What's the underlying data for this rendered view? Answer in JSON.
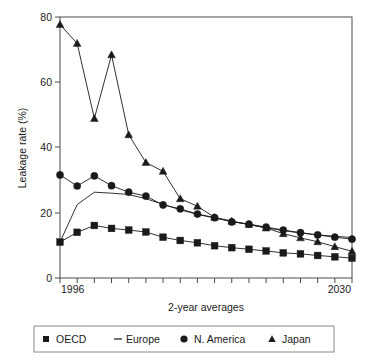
{
  "chart_data": {
    "type": "line",
    "title": "",
    "xlabel": "2-year averages",
    "ylabel": "Leakage rate (%)",
    "ylim": [
      0,
      80
    ],
    "yticks": [
      0,
      20,
      40,
      60,
      80
    ],
    "yticklabels": [
      "0",
      "20",
      "40",
      "60",
      "80"
    ],
    "xlim": [
      0,
      17
    ],
    "xticklabels": [
      "1996",
      "2030"
    ],
    "x_first_label": "1996",
    "x_last_label": "2030",
    "n_points": 18,
    "grid": false,
    "legend_position": "below",
    "series": [
      {
        "name": "OECD",
        "marker": "square",
        "values": [
          11.0,
          14.0,
          16.1,
          15.2,
          14.7,
          14.1,
          12.5,
          11.5,
          10.8,
          9.9,
          9.3,
          8.8,
          8.3,
          7.7,
          7.4,
          6.9,
          6.5,
          6.1
        ]
      },
      {
        "name": "Europe",
        "marker": "line",
        "values": [
          11.0,
          22.5,
          26.3,
          26.0,
          25.6,
          24.3,
          22.6,
          20.9,
          19.5,
          18.4,
          17.4,
          16.4,
          15.4,
          14.5,
          13.8,
          13.2,
          12.8,
          12.4
        ]
      },
      {
        "name": "N. America",
        "marker": "circle",
        "values": [
          31.6,
          28.2,
          31.3,
          28.3,
          26.3,
          25.1,
          22.4,
          21.2,
          19.6,
          18.5,
          17.2,
          16.5,
          15.6,
          14.7,
          13.9,
          13.2,
          12.5,
          11.9
        ]
      },
      {
        "name": "Japan",
        "marker": "triangle",
        "values": [
          77.7,
          71.9,
          48.9,
          68.4,
          43.9,
          35.4,
          32.7,
          24.3,
          22.0,
          18.6,
          17.4,
          16.4,
          15.3,
          13.6,
          12.3,
          11.1,
          9.6,
          8.2
        ]
      }
    ]
  },
  "legend": {
    "items": [
      {
        "label": "OECD",
        "marker": "square-marker"
      },
      {
        "label": "Europe",
        "marker": "dash-marker"
      },
      {
        "label": "N. America",
        "marker": "circle-marker"
      },
      {
        "label": "Japan",
        "marker": "triangle-marker"
      }
    ]
  },
  "colors": {
    "ink": "#1a1a1a",
    "axis": "#4a4a4a",
    "legend_border": "#8a8a8a",
    "background": "#ffffff"
  }
}
